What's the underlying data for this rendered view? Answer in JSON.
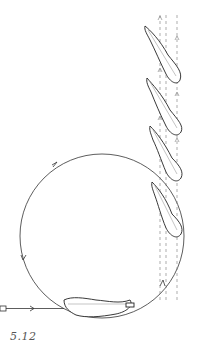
{
  "figure": {
    "caption": "5.12",
    "stroke_color": "#333333",
    "dash_color": "#777777",
    "elements": [
      {
        "name": "entry-path",
        "description": "horizontal line with arrow entering from left"
      },
      {
        "name": "loop-circle",
        "description": "large circular loop with direction arrows"
      },
      {
        "name": "vertical-rise",
        "description": "dashed vertical guide lines with upward arrows"
      },
      {
        "name": "feather-positions",
        "count": 6
      }
    ]
  }
}
